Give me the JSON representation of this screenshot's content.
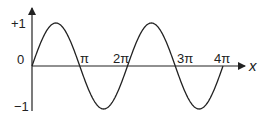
{
  "chart_data": {
    "type": "line",
    "title": "",
    "xlabel": "x",
    "ylabel": "",
    "function": "sin(x)",
    "x_range": [
      0,
      12.566
    ],
    "ylim": [
      -1,
      1
    ],
    "grid": false,
    "legend": null,
    "x_ticks": [
      "π",
      "2π",
      "3π",
      "4π"
    ],
    "y_ticks": [
      "+1",
      "0",
      "−1"
    ],
    "series": [
      {
        "name": "sin x",
        "x": [
          "0",
          "π/2",
          "π",
          "3π/2",
          "2π",
          "5π/2",
          "3π",
          "7π/2",
          "4π"
        ],
        "values": [
          0,
          1,
          0,
          -1,
          0,
          1,
          0,
          -1,
          0
        ]
      }
    ]
  },
  "labels": {
    "y_plus_one": "+1",
    "origin": "0",
    "y_minus_one": "−1",
    "pi": "π",
    "two_pi": "2π",
    "three_pi": "3π",
    "four_pi": "4π",
    "x_axis": "x"
  },
  "colors": {
    "stroke": "#222222"
  }
}
